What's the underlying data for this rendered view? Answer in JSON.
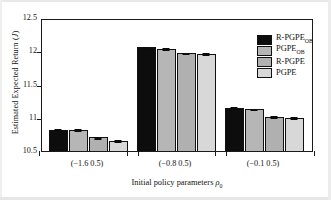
{
  "figure": {
    "background": "#ffffff",
    "frame_color": "#1a1a1a"
  },
  "chart_data": {
    "type": "bar",
    "title": "",
    "subtitle": "",
    "xlabel": "Initial policy parameters ρ₀",
    "xlabel_main": "Initial policy parameters",
    "xlabel_symbol": "ρ",
    "xlabel_symbol_sub": "0",
    "ylabel": "Estimated Expected Return (J)",
    "ylabel_main": "Estimated Expected Return (",
    "ylabel_symbol": "J",
    "ylabel_tail": ")",
    "categories": [
      "(−1.6 0.5)",
      "(−0.8 0.5)",
      "(−0.1 0.5)"
    ],
    "ylim": [
      10.5,
      12.5
    ],
    "yticks": [
      10.5,
      11,
      11.5,
      12,
      12.5
    ],
    "ytick_labels": [
      "10.5",
      "11",
      "11.5",
      "12",
      "12.5"
    ],
    "grid": false,
    "legend_position": "top-right",
    "series": [
      {
        "name": "R-PGPE_OB",
        "label_main": "R-PGPE",
        "label_sub": "OB",
        "color": "#0d0d0d",
        "values": [
          10.82,
          12.06,
          11.15
        ],
        "errors": [
          0.012,
          0.012,
          0.012
        ]
      },
      {
        "name": "PGPE_OB",
        "label_main": "PGPE",
        "label_sub": "OB",
        "color": "#b6b6b6",
        "values": [
          10.82,
          12.04,
          11.13
        ],
        "errors": [
          0.012,
          0.012,
          0.012
        ]
      },
      {
        "name": "R-PGPE",
        "label_main": "R-PGPE",
        "label_sub": "",
        "color": "#b0b0b0",
        "values": [
          10.705,
          11.975,
          11.015
        ],
        "errors": [
          0.012,
          0.012,
          0.012
        ]
      },
      {
        "name": "PGPE",
        "label_main": "PGPE",
        "label_sub": "",
        "color": "#d8d8d8",
        "values": [
          10.655,
          11.965,
          11.0
        ],
        "errors": [
          0.012,
          0.012,
          0.012
        ]
      }
    ]
  }
}
